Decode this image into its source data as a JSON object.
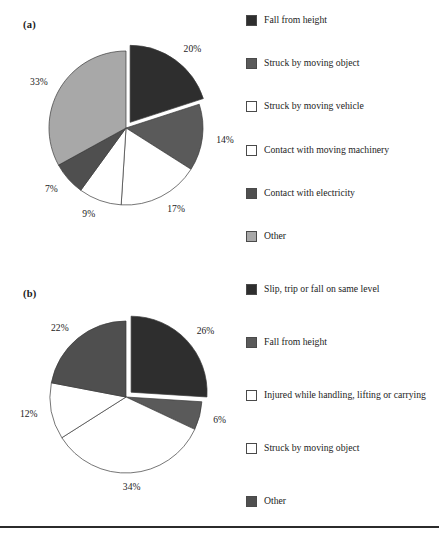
{
  "panels": {
    "a": {
      "label": "(a)"
    },
    "b": {
      "label": "(b)"
    }
  },
  "colors": {
    "very_dark": "#2e2e2e",
    "dark": "#3d3d3d",
    "mid_dark": "#4f4f4f",
    "mid": "#5a5a5a",
    "light_gray": "#a8a8a8",
    "white": "#ffffff",
    "outline": "#4a4a4a",
    "rule": "#2b2b2b"
  },
  "legend_a": {
    "items": [
      {
        "label": "Fall from height",
        "swatch": "very_dark",
        "icon": "legend-swatch-icon"
      },
      {
        "label": "Struck by moving object",
        "swatch": "mid",
        "icon": "legend-swatch-icon"
      },
      {
        "label": "Struck by moving vehicle",
        "swatch": "white",
        "icon": "legend-swatch-icon"
      },
      {
        "label": "Contact with moving machinery",
        "swatch": "white",
        "icon": "legend-swatch-icon"
      },
      {
        "label": "Contact with electricity",
        "swatch": "mid_dark",
        "icon": "legend-swatch-icon"
      },
      {
        "label": "Other",
        "swatch": "light_gray",
        "icon": "legend-swatch-icon"
      }
    ]
  },
  "legend_b": {
    "items": [
      {
        "label": "Slip, trip or fall on same level",
        "swatch": "very_dark",
        "icon": "legend-swatch-icon"
      },
      {
        "label": "Fall from height",
        "swatch": "mid",
        "icon": "legend-swatch-icon"
      },
      {
        "label": "Injured while handling, lifting or carrying",
        "swatch": "white",
        "icon": "legend-swatch-icon"
      },
      {
        "label": "Struck by moving object",
        "swatch": "white",
        "icon": "legend-swatch-icon"
      },
      {
        "label": "Other",
        "swatch": "mid_dark",
        "icon": "legend-swatch-icon"
      }
    ]
  },
  "chart_data": [
    {
      "type": "pie",
      "title": "(a)",
      "categories": [
        "Fall from height",
        "Struck by moving object",
        "Struck by moving vehicle",
        "Contact with moving machinery",
        "Contact with electricity",
        "Other"
      ],
      "values": [
        20,
        14,
        17,
        9,
        7,
        33
      ],
      "labels": [
        "20%",
        "14%",
        "17%",
        "9%",
        "7%",
        "33%"
      ],
      "colors": [
        "#2e2e2e",
        "#5a5a5a",
        "#ffffff",
        "#ffffff",
        "#4f4f4f",
        "#a8a8a8"
      ],
      "exploded": [
        true,
        false,
        false,
        false,
        false,
        false
      ],
      "start_angle_deg": 0,
      "direction": "clockwise",
      "legend_position": "right"
    },
    {
      "type": "pie",
      "title": "(b)",
      "categories": [
        "Slip, trip or fall on same level",
        "Fall from height",
        "Injured while handling, lifting or carrying",
        "Struck by moving object",
        "Other"
      ],
      "values": [
        26,
        6,
        34,
        12,
        22
      ],
      "labels": [
        "26%",
        "6%",
        "34%",
        "12%",
        "22%"
      ],
      "colors": [
        "#2e2e2e",
        "#5a5a5a",
        "#ffffff",
        "#ffffff",
        "#4f4f4f"
      ],
      "exploded": [
        true,
        false,
        false,
        false,
        false
      ],
      "start_angle_deg": 0,
      "direction": "clockwise",
      "legend_position": "right"
    }
  ]
}
